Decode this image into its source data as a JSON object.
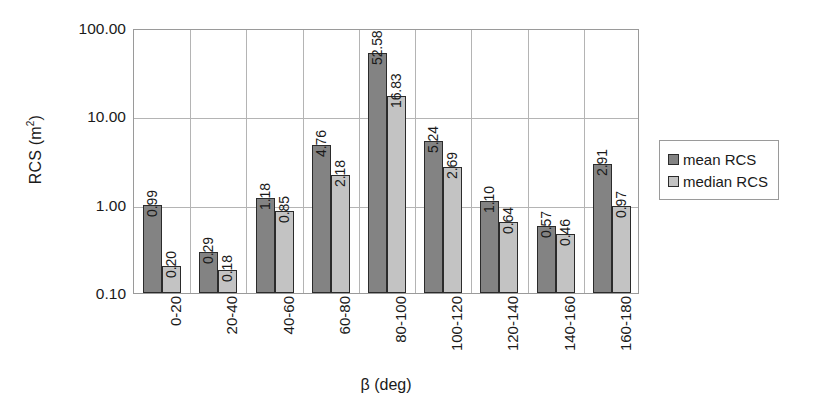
{
  "chart_data": {
    "type": "bar",
    "title": "",
    "xlabel": "β (deg)",
    "ylabel": "RCS (m²)",
    "ylabel_text": "RCS (m",
    "ylabel_sup": "2",
    "ylabel_tail": ")",
    "yscale": "log",
    "ylim": [
      0.1,
      100.0
    ],
    "grid": true,
    "legend_position": "right",
    "categories": [
      "0-20",
      "20-40",
      "40-60",
      "60-80",
      "80-100",
      "100-120",
      "120-140",
      "140-160",
      "160-180"
    ],
    "ytick_labels": [
      "100.00",
      "10.00",
      "1.00",
      "0.10"
    ],
    "ytick_values": [
      100.0,
      10.0,
      1.0,
      0.1
    ],
    "series": [
      {
        "name": "mean RCS",
        "color": "#838383",
        "values": [
          0.99,
          0.29,
          1.18,
          4.76,
          52.58,
          5.24,
          1.1,
          0.57,
          2.91
        ],
        "labels": [
          "0.99",
          "0.29",
          "1.18",
          "4.76",
          "52.58",
          "5.24",
          "1.10",
          "0.57",
          "2.91"
        ]
      },
      {
        "name": "median RCS",
        "color": "#c3c3c3",
        "values": [
          0.2,
          0.18,
          0.85,
          2.18,
          16.83,
          2.69,
          0.64,
          0.46,
          0.97
        ],
        "labels": [
          "0.20",
          "0.18",
          "0.85",
          "2.18",
          "16.83",
          "2.69",
          "0.64",
          "0.46",
          "0.97"
        ]
      }
    ]
  },
  "legend": {
    "items": [
      {
        "label": "mean RCS",
        "swatch": "mean"
      },
      {
        "label": "median RCS",
        "swatch": "median"
      }
    ]
  }
}
